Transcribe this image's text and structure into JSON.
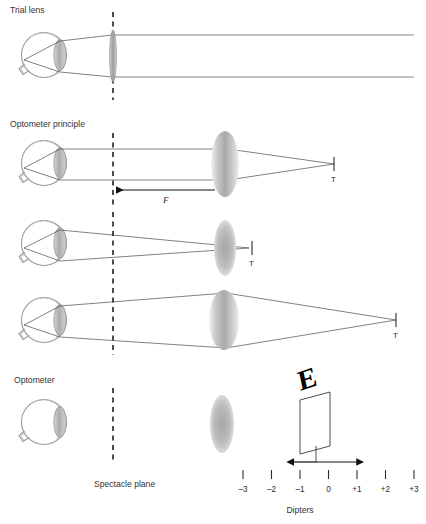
{
  "figure": {
    "width": 426,
    "height": 524,
    "background": "#ffffff",
    "line_color": "#4a4a4a",
    "eye_outline_color": "#999999",
    "lens_color": "#9e9e9e",
    "text_color": "#333333"
  },
  "sections": [
    {
      "id": "trial-lens",
      "title": "Trial lens"
    },
    {
      "id": "optometer-principle",
      "title": "Optometer principle"
    },
    {
      "id": "optometer",
      "title": "Optometer"
    }
  ],
  "annotations": {
    "spectacle_plane": "Spectacle plane",
    "focal_distance": "F",
    "target_labels": [
      "T",
      "T",
      "T"
    ],
    "diopter_axis_label": "Dipters"
  },
  "diopter_scale": {
    "label": "Dipters",
    "ticks": [
      "–3",
      "–2",
      "–1",
      "0",
      "+1",
      "+2",
      "+3"
    ],
    "values": [
      -3,
      -2,
      -1,
      0,
      1,
      2,
      3
    ],
    "highlighted_range": [
      "–1",
      "+1"
    ]
  },
  "optotype": {
    "letter": "E",
    "card_color": "#ffffff",
    "letter_color": "#000000"
  },
  "chart_data": {
    "type": "diagram",
    "title": "Optometer principle",
    "elements": [
      {
        "row": "trial lens",
        "description": "Eye with parallel rays leaving through a thin trial lens placed at the spectacle plane",
        "ray_geometry": "parallel",
        "target": null
      },
      {
        "row": "optometer principle 1",
        "description": "Parallel rays from the eye pass the spectacle plane, refract at the optometer lens and converge on target T at the far right",
        "ray_geometry": "parallel then converging",
        "target": "T",
        "focal_marker": "F"
      },
      {
        "row": "optometer principle 2",
        "description": "Converging rays from the eye focus on a near target T just beyond the optometer lens",
        "ray_geometry": "converging",
        "target": "T"
      },
      {
        "row": "optometer principle 3",
        "description": "Diverging rays from the eye are refracted by the optometer lens to a distant target T",
        "ray_geometry": "diverging then converging",
        "target": "T"
      },
      {
        "row": "optometer",
        "description": "Eye, spectacle plane, optometer lens and a movable E optotype card sliding along a dioptre scale",
        "ray_geometry": "none",
        "target": "E card"
      }
    ],
    "xlabel": "Dipters",
    "xticks": [
      -3,
      -2,
      -1,
      0,
      1,
      2,
      3
    ]
  }
}
